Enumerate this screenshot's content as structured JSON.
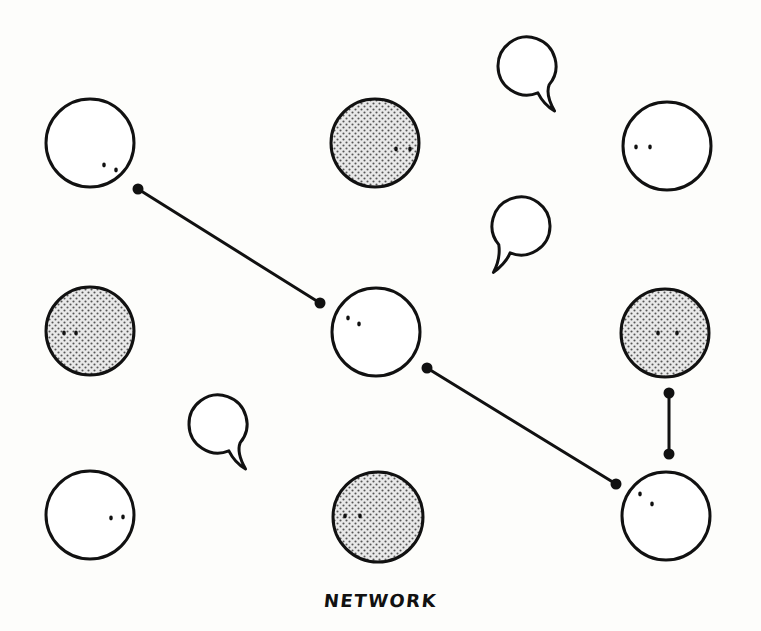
{
  "diagram": {
    "caption": "NETWORK",
    "colors": {
      "stroke": "#111111",
      "fill_plain": "#ffffff",
      "fill_dotted_dot": "#555555",
      "fill_dotted_bg": "#e6e6e6",
      "background": "#fdfdfb"
    },
    "nodes": [
      {
        "id": "n1",
        "row": 1,
        "col": 1,
        "cx": 90,
        "cy": 143,
        "r": 44,
        "style": "plain",
        "eyes": [
          [
            104,
            165
          ],
          [
            116,
            170
          ]
        ]
      },
      {
        "id": "n2",
        "row": 1,
        "col": 2,
        "cx": 375,
        "cy": 143,
        "r": 44,
        "style": "dotted",
        "eyes": [
          [
            396,
            149
          ],
          [
            410,
            149
          ]
        ]
      },
      {
        "id": "n3",
        "row": 1,
        "col": 3,
        "cx": 667,
        "cy": 146,
        "r": 44,
        "style": "plain",
        "eyes": [
          [
            636,
            147
          ],
          [
            650,
            147
          ]
        ]
      },
      {
        "id": "n4",
        "row": 2,
        "col": 1,
        "cx": 90,
        "cy": 331,
        "r": 44,
        "style": "dotted",
        "eyes": [
          [
            64,
            333
          ],
          [
            76,
            333
          ]
        ]
      },
      {
        "id": "n5",
        "row": 2,
        "col": 2,
        "cx": 376,
        "cy": 332,
        "r": 44,
        "style": "plain",
        "eyes": [
          [
            348,
            318
          ],
          [
            359,
            324
          ]
        ]
      },
      {
        "id": "n6",
        "row": 2,
        "col": 3,
        "cx": 665,
        "cy": 333,
        "r": 44,
        "style": "dotted",
        "eyes": [
          [
            658,
            333
          ],
          [
            677,
            333
          ]
        ]
      },
      {
        "id": "n7",
        "row": 3,
        "col": 1,
        "cx": 90,
        "cy": 515,
        "r": 44,
        "style": "plain",
        "eyes": [
          [
            111,
            518
          ],
          [
            123,
            517
          ]
        ]
      },
      {
        "id": "n8",
        "row": 3,
        "col": 2,
        "cx": 378,
        "cy": 517,
        "r": 45,
        "style": "dotted",
        "eyes": [
          [
            345,
            516
          ],
          [
            360,
            516
          ]
        ]
      },
      {
        "id": "n9",
        "row": 3,
        "col": 3,
        "cx": 666,
        "cy": 516,
        "r": 44,
        "style": "plain",
        "eyes": [
          [
            640,
            494
          ],
          [
            652,
            504
          ]
        ]
      }
    ],
    "links": [
      {
        "id": "l1",
        "from": "n1",
        "to": "n5",
        "x1": 138,
        "y1": 189,
        "x2": 320,
        "y2": 303
      },
      {
        "id": "l2",
        "from": "n5",
        "to": "n9",
        "x1": 427,
        "y1": 368,
        "x2": 616,
        "y2": 484
      },
      {
        "id": "l3",
        "from": "n6",
        "to": "n9",
        "x1": 669,
        "y1": 393,
        "x2": 669,
        "y2": 454
      }
    ],
    "speech_bubbles": [
      {
        "id": "b1",
        "cx": 527,
        "cy": 66,
        "r": 29,
        "tail": "bottom-right"
      },
      {
        "id": "b2",
        "cx": 521,
        "cy": 226,
        "r": 29,
        "tail": "bottom-left"
      },
      {
        "id": "b3",
        "cx": 218,
        "cy": 424,
        "r": 29,
        "tail": "bottom-right"
      }
    ]
  }
}
